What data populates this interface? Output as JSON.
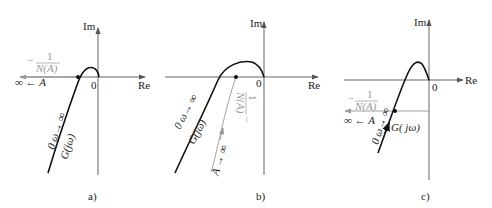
{
  "panels": [
    {
      "id": "a",
      "caption": "a)",
      "axis_labels": {
        "im": "Im",
        "re": "Re",
        "origin": "0"
      },
      "curve_label": "G(jω)",
      "omega_label": "0 ω→ ∞",
      "describing_fn_label": "−1/N(A)",
      "describing_fn_num": "1",
      "describing_fn_den": "N(A)",
      "describing_fn_minus": "−",
      "amplitude_label": "∞ ← A"
    },
    {
      "id": "b",
      "caption": "b)",
      "axis_labels": {
        "im": "Im",
        "re": "Re",
        "origin": "0"
      },
      "curve_label": "G(jω)",
      "omega_label": "0 ω→ ∞",
      "describing_fn_label": "−1/N(A)",
      "describing_fn_num": "1",
      "describing_fn_den": "N(A)",
      "describing_fn_minus": "−",
      "amplitude_label": "A → ∞"
    },
    {
      "id": "c",
      "caption": "c)",
      "axis_labels": {
        "im": "Im",
        "re": "Re",
        "origin": "0"
      },
      "curve_label": "G( jω)",
      "omega_label": "0 ω→ ∞",
      "describing_fn_label": "−1/N(A)",
      "describing_fn_num": "1",
      "describing_fn_den": "N(A)",
      "describing_fn_minus": "−",
      "amplitude_label": "∞ ← A"
    }
  ],
  "colors": {
    "axis": "#555555",
    "curve": "#111111",
    "describing_fn": "#999999"
  }
}
